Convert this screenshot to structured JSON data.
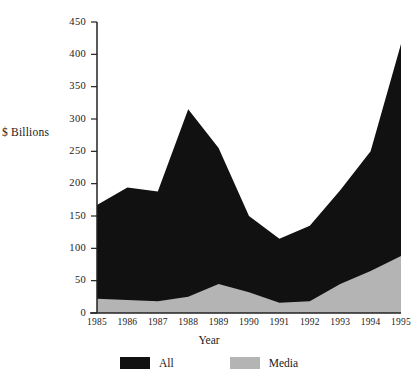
{
  "chart_data": {
    "type": "area",
    "title": "",
    "xlabel": "Year",
    "ylabel": "$ Billions",
    "categories": [
      "1985",
      "1986",
      "1987",
      "1988",
      "1989",
      "1990",
      "1991",
      "1992",
      "1993",
      "1994",
      "1995"
    ],
    "x": [
      1985,
      1986,
      1987,
      1988,
      1989,
      1990,
      1991,
      1992,
      1993,
      1994,
      1995
    ],
    "series": [
      {
        "name": "All",
        "color": "#111111",
        "values": [
          167,
          194,
          188,
          315,
          255,
          150,
          115,
          135,
          190,
          250,
          416
        ]
      },
      {
        "name": "Media",
        "color": "#b4b4b4",
        "values": [
          22,
          20,
          18,
          25,
          45,
          32,
          16,
          18,
          45,
          65,
          88
        ]
      }
    ],
    "ylim": [
      0,
      450
    ],
    "yticks": [
      0,
      50,
      100,
      150,
      200,
      250,
      300,
      350,
      400,
      450
    ],
    "ytick_labels": [
      "0",
      "50",
      "100",
      "150",
      "200",
      "250",
      "300",
      "350",
      "400",
      "450"
    ],
    "grid": false,
    "legend_position": "bottom",
    "stacked": false,
    "overlay_note": "Media area drawn on top of All area"
  },
  "legend": {
    "items": [
      {
        "label": "All",
        "color": "#111111"
      },
      {
        "label": "Media",
        "color": "#b4b4b4"
      }
    ]
  },
  "axes": {
    "y_title": "$ Billions",
    "x_title": "Year",
    "axis_color": "#222222"
  }
}
